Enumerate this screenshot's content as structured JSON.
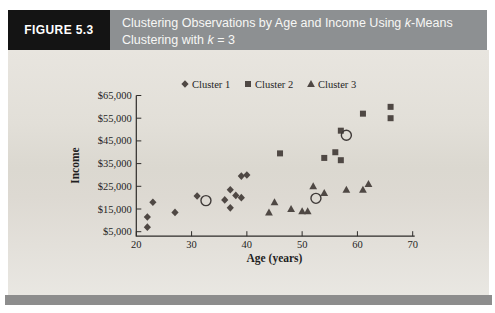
{
  "figure": {
    "label": "FIGURE 5.3",
    "title_parts": [
      {
        "text": "Clustering Observations by Age and Income Using "
      },
      {
        "text": "k",
        "italic": true
      },
      {
        "text": "-Means"
      },
      {
        "break": true
      },
      {
        "text": "Clustering with "
      },
      {
        "text": "k",
        "italic": true
      },
      {
        "text": " = 3"
      }
    ]
  },
  "colors": {
    "header_label_bg": "#141414",
    "header_title_bg": "#8d9092",
    "body_bg": "#e0ddd6",
    "footer_band": "#8d8d8d",
    "marker": "#4f4844",
    "centroid_stroke": "#3f3a38",
    "axis": "#2e2c2a",
    "text": "#1f1f1f"
  },
  "chart_data": {
    "type": "scatter",
    "title": "",
    "xlabel": "Age (years)",
    "ylabel": "Income",
    "xlim": [
      20,
      70
    ],
    "ylim": [
      5000,
      65000
    ],
    "grid": false,
    "legend_position": "top-center",
    "x_ticks": [
      {
        "value": 20,
        "label": "20"
      },
      {
        "value": 30,
        "label": "30"
      },
      {
        "value": 40,
        "label": "40"
      },
      {
        "value": 50,
        "label": "50"
      },
      {
        "value": 60,
        "label": "60"
      },
      {
        "value": 70,
        "label": "70"
      }
    ],
    "y_ticks": [
      {
        "value": 5000,
        "label": "$5,000"
      },
      {
        "value": 15000,
        "label": "$15,000"
      },
      {
        "value": 25000,
        "label": "$25,000"
      },
      {
        "value": 35000,
        "label": "$35,000"
      },
      {
        "value": 45000,
        "label": "$45,000"
      },
      {
        "value": 55000,
        "label": "$55,000"
      },
      {
        "value": 65000,
        "label": "$65,000"
      }
    ],
    "series": [
      {
        "name": "Cluster 1",
        "marker": "diamond",
        "points": [
          [
            22,
            7000
          ],
          [
            22,
            11500
          ],
          [
            23,
            18000
          ],
          [
            27,
            13500
          ],
          [
            31,
            20700
          ],
          [
            36,
            19000
          ],
          [
            37,
            23500
          ],
          [
            37,
            15500
          ],
          [
            38,
            21000
          ],
          [
            39,
            20000
          ],
          [
            39,
            29500
          ],
          [
            40,
            30000
          ]
        ]
      },
      {
        "name": "Cluster 2",
        "marker": "square",
        "points": [
          [
            46,
            39500
          ],
          [
            54,
            37500
          ],
          [
            56,
            40000
          ],
          [
            57,
            36500
          ],
          [
            57,
            49500
          ],
          [
            61,
            57000
          ],
          [
            66,
            60000
          ],
          [
            66,
            55000
          ]
        ]
      },
      {
        "name": "Cluster 3",
        "marker": "triangle",
        "points": [
          [
            44,
            13500
          ],
          [
            45,
            18000
          ],
          [
            48,
            15000
          ],
          [
            50,
            14000
          ],
          [
            51,
            14000
          ],
          [
            52,
            25000
          ],
          [
            54,
            22000
          ],
          [
            58,
            23500
          ],
          [
            61,
            23500
          ],
          [
            62,
            26000
          ]
        ]
      }
    ],
    "centroids": [
      {
        "cluster": "Cluster 1",
        "point": [
          32.6,
          18700
        ]
      },
      {
        "cluster": "Cluster 2",
        "point": [
          58.0,
          47500
        ]
      },
      {
        "cluster": "Cluster 3",
        "point": [
          52.5,
          19700
        ]
      }
    ]
  }
}
